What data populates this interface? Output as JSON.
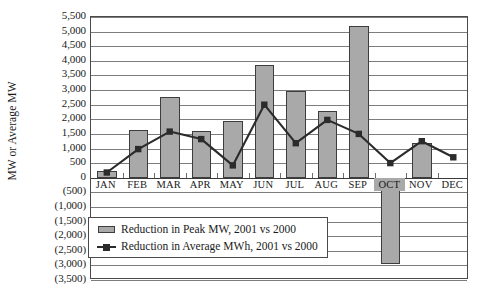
{
  "chart_data": {
    "type": "bar",
    "title": "",
    "xlabel": "",
    "ylabel": "MW or Average MW",
    "ylim": [
      -3500,
      5500
    ],
    "ytick_step": 500,
    "grid": true,
    "legend_position": "inside-bottom-left",
    "ytick_labels": [
      "5,500",
      "5,000",
      "4,500",
      "4,000",
      "3,500",
      "3,000",
      "2,500",
      "2,000",
      "1,500",
      "1,000",
      "500",
      "0",
      "(500)",
      "(1,000)",
      "(1,500)",
      "(2,000)",
      "(2,500)",
      "(3,000)",
      "(3,500)"
    ],
    "ytick_values": [
      5500,
      5000,
      4500,
      4000,
      3500,
      3000,
      2500,
      2000,
      1500,
      1000,
      500,
      0,
      -500,
      -1000,
      -1500,
      -2000,
      -2500,
      -3000,
      -3500
    ],
    "categories": [
      "JAN",
      "FEB",
      "MAR",
      "APR",
      "MAY",
      "JUN",
      "JUL",
      "AUG",
      "SEP",
      "OCT",
      "NOV",
      "DEC"
    ],
    "series": [
      {
        "name": "Reduction in Peak MW, 2001 vs 2000",
        "type": "bar",
        "color": "#a9a9a9",
        "values": [
          220,
          1650,
          2770,
          1600,
          1950,
          3850,
          2980,
          2270,
          5200,
          -2950,
          1200,
          0
        ]
      },
      {
        "name": "Reduction in Average MWh, 2001 vs 2000",
        "type": "line",
        "color": "#2b2b2b",
        "marker": "square",
        "values": [
          180,
          980,
          1580,
          1320,
          420,
          2500,
          1180,
          1980,
          1500,
          500,
          1250,
          700
        ]
      }
    ]
  },
  "legend": {
    "items": [
      {
        "label": "Reduction in Peak MW, 2001 vs 2000",
        "key": "bar-swatch"
      },
      {
        "label": "Reduction in Average MWh, 2001 vs 2000",
        "key": "line-marker"
      }
    ]
  }
}
